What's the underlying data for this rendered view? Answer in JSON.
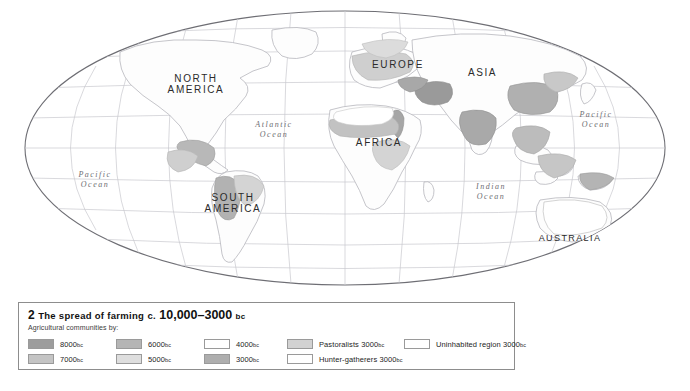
{
  "map": {
    "projection": "elliptical world projection",
    "background_color": "#ffffff",
    "graticule_color": "#c9c9cf",
    "coastline_color": "#b6b6bc",
    "continents": [
      {
        "name": "NORTH\nAMERICA",
        "line1": "NORTH",
        "line2": "AMERICA",
        "x": 196,
        "y": 79
      },
      {
        "name": "SOUTH\nAMERICA",
        "line1": "SOUTH",
        "line2": "AMERICA",
        "x": 233,
        "y": 198
      },
      {
        "name": "EUROPE",
        "line1": "EUROPE",
        "line2": "",
        "x": 398,
        "y": 65
      },
      {
        "name": "ASIA",
        "line1": "ASIA",
        "line2": "",
        "x": 482,
        "y": 73
      },
      {
        "name": "AFRICA",
        "line1": "AFRICA",
        "line2": "",
        "x": 379,
        "y": 143
      },
      {
        "name": "AUSTRALIA",
        "line1": "AUSTRALIA",
        "line2": "",
        "x": 570,
        "y": 239
      }
    ],
    "oceans": [
      {
        "line1": "Pacific",
        "line2": "Ocean",
        "x": 95,
        "y": 177
      },
      {
        "line1": "Atlantic",
        "line2": "Ocean",
        "x": 274,
        "y": 127
      },
      {
        "line1": "Pacific",
        "line2": "Ocean",
        "x": 596,
        "y": 117
      },
      {
        "line1": "Indian",
        "line2": "Ocean",
        "x": 491,
        "y": 189
      }
    ]
  },
  "legend": {
    "number": "2",
    "title_small_caps": "The spread of farming",
    "title_c": "c.",
    "title_range": "10,000–3000",
    "title_era": "bc",
    "subtitle": "Agricultural communities by:",
    "columns": [
      {
        "items": [
          {
            "label": "8000",
            "era": "bc",
            "color": "#9d9d9d"
          },
          {
            "label": "7000",
            "era": "bc",
            "color": "#c4c4c4"
          }
        ]
      },
      {
        "items": [
          {
            "label": "6000",
            "era": "bc",
            "color": "#b5b5b5"
          },
          {
            "label": "5000",
            "era": "bc",
            "color": "#dedede"
          }
        ]
      },
      {
        "items": [
          {
            "label": "4000",
            "era": "bc",
            "color": "#ffffff"
          },
          {
            "label": "3000",
            "era": "bc",
            "color": "#aeaeae"
          }
        ]
      },
      {
        "items": [
          {
            "label": "Pastoralists 3000",
            "era": "bc",
            "color": "#d2d2d2"
          },
          {
            "label": "Hunter-gatherers 3000",
            "era": "bc",
            "color": "#ffffff"
          }
        ]
      },
      {
        "items": [
          {
            "label": "Uninhabited region 3000",
            "era": "bc",
            "color": "#ffffff"
          }
        ]
      }
    ]
  }
}
